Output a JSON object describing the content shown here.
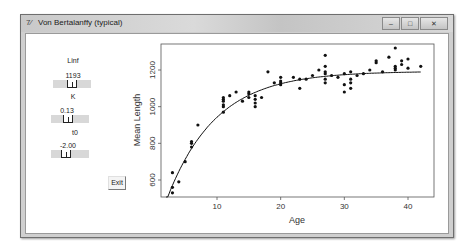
{
  "window": {
    "title": "Von Bertalanffy (typical)",
    "app_icon": "tk-feather-icon",
    "controls": {
      "minimize": "–",
      "maximize": "□",
      "close": "✕"
    }
  },
  "controls": {
    "linf": {
      "label": "Linf",
      "value": "1193"
    },
    "k": {
      "label": "K",
      "value": "0.13"
    },
    "t0": {
      "label": "t0",
      "value": "-2.00"
    },
    "exit_label": "Exit"
  },
  "chart_data": {
    "type": "scatter",
    "title": "",
    "xlabel": "Age",
    "ylabel": "Mean Length",
    "xlim": [
      1.5,
      44
    ],
    "ylim": [
      500,
      1340
    ],
    "xticks": [
      10,
      20,
      30,
      40
    ],
    "yticks": [
      600,
      800,
      1000,
      1200
    ],
    "grid": false,
    "legend": null,
    "fit_curve": {
      "model": "von_bertalanffy",
      "Linf": 1193,
      "K": 0.13,
      "t0": -2.0,
      "x_range": [
        2,
        42
      ]
    },
    "points": [
      [
        3,
        530
      ],
      [
        3,
        560
      ],
      [
        3,
        640
      ],
      [
        4,
        590
      ],
      [
        5,
        700
      ],
      [
        6,
        780
      ],
      [
        6,
        800
      ],
      [
        6,
        810
      ],
      [
        7,
        900
      ],
      [
        11,
        970
      ],
      [
        11,
        1000
      ],
      [
        11,
        1010
      ],
      [
        11,
        1030
      ],
      [
        11,
        1040
      ],
      [
        11,
        1050
      ],
      [
        12,
        1060
      ],
      [
        13,
        1080
      ],
      [
        14,
        1030
      ],
      [
        15,
        1050
      ],
      [
        15,
        1070
      ],
      [
        15,
        1080
      ],
      [
        16,
        1000
      ],
      [
        16,
        1020
      ],
      [
        16,
        1040
      ],
      [
        16,
        1060
      ],
      [
        17,
        1050
      ],
      [
        18,
        1190
      ],
      [
        19,
        1130
      ],
      [
        20,
        1120
      ],
      [
        20,
        1130
      ],
      [
        20,
        1140
      ],
      [
        20,
        1160
      ],
      [
        22,
        1160
      ],
      [
        23,
        1100
      ],
      [
        23,
        1150
      ],
      [
        24,
        1150
      ],
      [
        25,
        1170
      ],
      [
        26,
        1200
      ],
      [
        27,
        1130
      ],
      [
        27,
        1150
      ],
      [
        27,
        1180
      ],
      [
        27,
        1190
      ],
      [
        27,
        1220
      ],
      [
        27,
        1280
      ],
      [
        28,
        1170
      ],
      [
        29,
        1160
      ],
      [
        30,
        1080
      ],
      [
        30,
        1120
      ],
      [
        30,
        1180
      ],
      [
        31,
        1100
      ],
      [
        31,
        1130
      ],
      [
        31,
        1150
      ],
      [
        31,
        1190
      ],
      [
        32,
        1170
      ],
      [
        33,
        1180
      ],
      [
        34,
        1200
      ],
      [
        35,
        1240
      ],
      [
        35,
        1250
      ],
      [
        36,
        1190
      ],
      [
        37,
        1270
      ],
      [
        38,
        1320
      ],
      [
        38,
        1200
      ],
      [
        38,
        1210
      ],
      [
        38,
        1220
      ],
      [
        39,
        1230
      ],
      [
        39,
        1250
      ],
      [
        40,
        1260
      ],
      [
        40,
        1210
      ],
      [
        42,
        1220
      ]
    ]
  }
}
